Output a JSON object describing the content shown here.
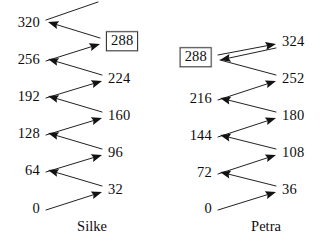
{
  "page": {
    "background": "#ffffff",
    "ink": "#101010",
    "width": 328,
    "height": 248
  },
  "diagrams": [
    {
      "id": "silke",
      "caption": "Silke",
      "caption_x": 92,
      "caption_y": 219,
      "step": 32,
      "left_column": [
        {
          "label": "320",
          "x": 40,
          "y": 22,
          "boxed": false,
          "align": "right"
        },
        {
          "label": "256",
          "x": 40,
          "y": 59,
          "boxed": false,
          "align": "right"
        },
        {
          "label": "192",
          "x": 40,
          "y": 96,
          "boxed": false,
          "align": "right"
        },
        {
          "label": "128",
          "x": 40,
          "y": 133,
          "boxed": false,
          "align": "right"
        },
        {
          "label": "64",
          "x": 40,
          "y": 170,
          "boxed": false,
          "align": "right"
        },
        {
          "label": "0",
          "x": 40,
          "y": 208,
          "boxed": false,
          "align": "right"
        }
      ],
      "right_column": [
        {
          "label": "288",
          "x": 106,
          "y": 41,
          "boxed": true,
          "align": "left"
        },
        {
          "label": "224",
          "x": 108,
          "y": 78,
          "boxed": false,
          "align": "left"
        },
        {
          "label": "160",
          "x": 108,
          "y": 115,
          "boxed": false,
          "align": "left"
        },
        {
          "label": "96",
          "x": 108,
          "y": 152,
          "boxed": false,
          "align": "left"
        },
        {
          "label": "32",
          "x": 108,
          "y": 189,
          "boxed": false,
          "align": "left"
        }
      ],
      "arrows": [
        {
          "from": "320",
          "to": "(off-top)",
          "x1": 46,
          "y1": 20,
          "x2": 98,
          "y2": 2,
          "head": false,
          "direction": "up-right"
        },
        {
          "from": "288",
          "to": "320",
          "x1": 100,
          "y1": 38,
          "x2": 48,
          "y2": 22,
          "head": true,
          "direction": "up-left"
        },
        {
          "from": "256",
          "to": "288",
          "x1": 46,
          "y1": 61,
          "x2": 100,
          "y2": 44,
          "head": true,
          "direction": "up-right"
        },
        {
          "from": "224",
          "to": "256",
          "x1": 102,
          "y1": 75,
          "x2": 48,
          "y2": 59,
          "head": true,
          "direction": "up-left"
        },
        {
          "from": "192",
          "to": "224",
          "x1": 46,
          "y1": 98,
          "x2": 102,
          "y2": 81,
          "head": true,
          "direction": "up-right"
        },
        {
          "from": "160",
          "to": "192",
          "x1": 102,
          "y1": 112,
          "x2": 48,
          "y2": 96,
          "head": true,
          "direction": "up-left"
        },
        {
          "from": "128",
          "to": "160",
          "x1": 46,
          "y1": 135,
          "x2": 102,
          "y2": 118,
          "head": true,
          "direction": "up-right"
        },
        {
          "from": "96",
          "to": "128",
          "x1": 102,
          "y1": 149,
          "x2": 48,
          "y2": 133,
          "head": true,
          "direction": "up-left"
        },
        {
          "from": "64",
          "to": "96",
          "x1": 46,
          "y1": 172,
          "x2": 102,
          "y2": 155,
          "head": true,
          "direction": "up-right"
        },
        {
          "from": "32",
          "to": "64",
          "x1": 102,
          "y1": 186,
          "x2": 48,
          "y2": 170,
          "head": true,
          "direction": "up-left"
        },
        {
          "from": "0",
          "to": "32",
          "x1": 46,
          "y1": 210,
          "x2": 102,
          "y2": 192,
          "head": true,
          "direction": "up-right"
        }
      ]
    },
    {
      "id": "petra",
      "caption": "Petra",
      "caption_x": 266,
      "caption_y": 219,
      "step": 36,
      "left_column": [
        {
          "label": "288",
          "x": 48,
          "y": 57,
          "boxed": true,
          "align": "right"
        },
        {
          "label": "216",
          "x": 48,
          "y": 98,
          "boxed": false,
          "align": "right"
        },
        {
          "label": "144",
          "x": 48,
          "y": 135,
          "boxed": false,
          "align": "right"
        },
        {
          "label": "72",
          "x": 48,
          "y": 172,
          "boxed": false,
          "align": "right"
        },
        {
          "label": "0",
          "x": 48,
          "y": 208,
          "boxed": false,
          "align": "right"
        }
      ],
      "right_column": [
        {
          "label": "324",
          "x": 118,
          "y": 41,
          "boxed": false,
          "align": "left"
        },
        {
          "label": "252",
          "x": 118,
          "y": 78,
          "boxed": false,
          "align": "left"
        },
        {
          "label": "180",
          "x": 118,
          "y": 115,
          "boxed": false,
          "align": "left"
        },
        {
          "label": "108",
          "x": 118,
          "y": 152,
          "boxed": false,
          "align": "left"
        },
        {
          "label": "36",
          "x": 118,
          "y": 189,
          "boxed": false,
          "align": "left"
        }
      ],
      "arrows": [
        {
          "from": "288",
          "to": "324",
          "x1": 54,
          "y1": 55,
          "x2": 112,
          "y2": 44,
          "head": true,
          "direction": "up-right"
        },
        {
          "from": "324",
          "to": "288",
          "x1": 112,
          "y1": 48,
          "x2": 56,
          "y2": 60,
          "head": true,
          "direction": "down-left"
        },
        {
          "from": "252",
          "to": "288",
          "x1": 112,
          "y1": 75,
          "x2": 56,
          "y2": 60,
          "head": false,
          "direction": "up-left"
        },
        {
          "from": "216",
          "to": "252",
          "x1": 54,
          "y1": 100,
          "x2": 112,
          "y2": 81,
          "head": true,
          "direction": "up-right"
        },
        {
          "from": "180",
          "to": "216",
          "x1": 112,
          "y1": 112,
          "x2": 56,
          "y2": 98,
          "head": true,
          "direction": "up-left"
        },
        {
          "from": "144",
          "to": "180",
          "x1": 54,
          "y1": 137,
          "x2": 112,
          "y2": 118,
          "head": true,
          "direction": "up-right"
        },
        {
          "from": "108",
          "to": "144",
          "x1": 112,
          "y1": 149,
          "x2": 56,
          "y2": 135,
          "head": true,
          "direction": "up-left"
        },
        {
          "from": "72",
          "to": "108",
          "x1": 54,
          "y1": 174,
          "x2": 112,
          "y2": 155,
          "head": true,
          "direction": "up-right"
        },
        {
          "from": "36",
          "to": "72",
          "x1": 112,
          "y1": 186,
          "x2": 56,
          "y2": 172,
          "head": true,
          "direction": "up-left"
        },
        {
          "from": "0",
          "to": "36",
          "x1": 54,
          "y1": 210,
          "x2": 112,
          "y2": 192,
          "head": true,
          "direction": "up-right"
        }
      ]
    }
  ]
}
